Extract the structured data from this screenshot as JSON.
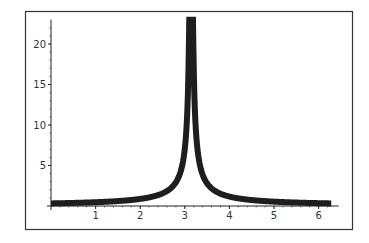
{
  "chart_data": {
    "type": "line",
    "title": "",
    "xlabel": "",
    "ylabel": "",
    "function": "y = 1/|x - pi|",
    "xlim": [
      0,
      6.2832
    ],
    "ylim": [
      0,
      23
    ],
    "x_ticks": [
      1,
      2,
      3,
      4,
      5,
      6
    ],
    "y_ticks": [
      5,
      10,
      15,
      20
    ],
    "x_tick_labels": [
      "1",
      "2",
      "3",
      "4",
      "5",
      "6"
    ],
    "y_tick_labels": [
      "5",
      "10",
      "15",
      "20"
    ],
    "grid": false,
    "legend": null,
    "frame": true,
    "series": [
      {
        "name": "1/|x-pi|",
        "color": "#1e1e1e",
        "line_width": 6,
        "x": [
          0,
          0.5,
          1,
          1.5,
          2,
          2.5,
          2.8,
          3.0,
          3.1,
          3.1416,
          3.18,
          3.28,
          3.5,
          4,
          4.5,
          5,
          5.5,
          6,
          6.2832
        ],
        "values": [
          0.32,
          0.38,
          0.47,
          0.61,
          0.88,
          1.56,
          2.93,
          7.06,
          23,
          23,
          23,
          7.06,
          2.79,
          1.16,
          0.74,
          0.54,
          0.42,
          0.35,
          0.32
        ]
      }
    ]
  },
  "layout": {
    "frame_color": "#333333",
    "axis_color": "#222222"
  }
}
